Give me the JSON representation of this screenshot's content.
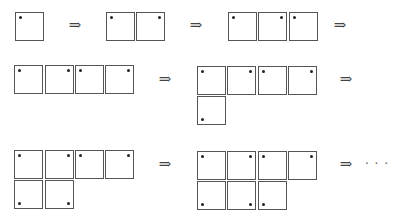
{
  "diagram": {
    "colors": {
      "cell_border": "#555555",
      "dot": "#222222",
      "arrow": "#444444",
      "background": "#ffffff"
    },
    "arrow_symbol": "⇒",
    "ellipsis_symbol": "· · ·",
    "figures": [
      {
        "id": "fig1",
        "cells": [
          {
            "x": 15,
            "y": 12,
            "dot": "tl"
          }
        ]
      },
      {
        "id": "fig2",
        "cells": [
          {
            "x": 106,
            "y": 12,
            "dot": "tl"
          },
          {
            "x": 136,
            "y": 12,
            "dot": "tr"
          }
        ]
      },
      {
        "id": "fig3",
        "cells": [
          {
            "x": 228,
            "y": 12,
            "dot": "tl"
          },
          {
            "x": 258,
            "y": 12,
            "dot": "tr"
          },
          {
            "x": 289,
            "y": 12,
            "dot": "tl"
          }
        ]
      },
      {
        "id": "fig4",
        "cells": [
          {
            "x": 14,
            "y": 65,
            "dot": "tl"
          },
          {
            "x": 45,
            "y": 65,
            "dot": "tr"
          },
          {
            "x": 75,
            "y": 65,
            "dot": "tl"
          },
          {
            "x": 105,
            "y": 65,
            "dot": "tr"
          }
        ]
      },
      {
        "id": "fig5",
        "cells": [
          {
            "x": 197,
            "y": 66,
            "dot": "tl"
          },
          {
            "x": 227,
            "y": 66,
            "dot": "tr"
          },
          {
            "x": 258,
            "y": 66,
            "dot": "tl"
          },
          {
            "x": 288,
            "y": 66,
            "dot": "tr"
          },
          {
            "x": 197,
            "y": 96,
            "dot": "bl"
          }
        ]
      },
      {
        "id": "fig6",
        "cells": [
          {
            "x": 14,
            "y": 150,
            "dot": "tl"
          },
          {
            "x": 45,
            "y": 150,
            "dot": "tr"
          },
          {
            "x": 75,
            "y": 150,
            "dot": "tl"
          },
          {
            "x": 105,
            "y": 150,
            "dot": "tr"
          },
          {
            "x": 14,
            "y": 180,
            "dot": "bl"
          },
          {
            "x": 45,
            "y": 180,
            "dot": "br"
          }
        ]
      },
      {
        "id": "fig7",
        "cells": [
          {
            "x": 197,
            "y": 151,
            "dot": "tl"
          },
          {
            "x": 227,
            "y": 151,
            "dot": "tr"
          },
          {
            "x": 258,
            "y": 151,
            "dot": "tl"
          },
          {
            "x": 288,
            "y": 151,
            "dot": "tr"
          },
          {
            "x": 197,
            "y": 181,
            "dot": "bl"
          },
          {
            "x": 227,
            "y": 181,
            "dot": "br"
          },
          {
            "x": 258,
            "y": 181,
            "dot": "bl"
          }
        ]
      }
    ],
    "arrows": [
      {
        "x": 75,
        "y": 25
      },
      {
        "x": 196,
        "y": 25
      },
      {
        "x": 340,
        "y": 25
      },
      {
        "x": 165,
        "y": 79
      },
      {
        "x": 346,
        "y": 79
      },
      {
        "x": 165,
        "y": 164
      },
      {
        "x": 346,
        "y": 164
      }
    ],
    "ellipsis": {
      "x": 377,
      "y": 164
    }
  }
}
